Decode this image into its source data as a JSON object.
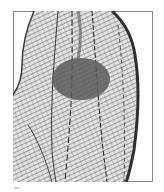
{
  "figure": {
    "frame": {
      "x": 13,
      "y": 11,
      "width": 140,
      "height": 171,
      "stroke": "#8a8a8a"
    },
    "shape": {
      "fill_light": "#d9d9d9",
      "fill_dark": "#555555",
      "hatch_color": "#3a3a3a"
    },
    "ellipse": {
      "cx": 81,
      "cy": 79,
      "rx": 29,
      "ry": 21,
      "fill": "#5a5a5a",
      "opacity": 0.85
    },
    "caption_mark": {
      "x": 14,
      "y": 188,
      "color": "#cfcfcf"
    }
  }
}
